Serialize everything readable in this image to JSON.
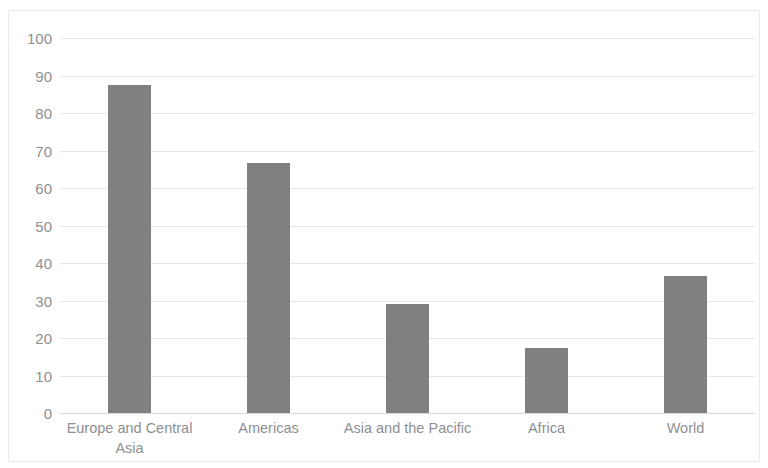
{
  "chart_data": {
    "type": "bar",
    "title": "",
    "subtitle": "",
    "xlabel": "",
    "ylabel": "",
    "categories": [
      "Europe and Central Asia",
      "Americas",
      "Asia and the Pacific",
      "Africa",
      "World"
    ],
    "values": [
      87.5,
      66.8,
      29.0,
      17.3,
      36.6
    ],
    "ylim": [
      0,
      100
    ],
    "yticks": [
      0,
      10,
      20,
      30,
      40,
      50,
      60,
      70,
      80,
      90,
      100
    ],
    "ytick_labels": [
      "0",
      "10",
      "20",
      "30",
      "40",
      "50",
      "60",
      "70",
      "80",
      "90",
      "100"
    ],
    "grid": true,
    "grid_axis": "y",
    "legend": false,
    "legend_position": "none",
    "series": [
      {
        "name": "",
        "values": [
          87.5,
          66.8,
          29.0,
          17.3,
          36.6
        ]
      }
    ],
    "colors": {
      "bar_fill": "#808080",
      "gridline": "#e6e7e9",
      "axis_line": "#d8d9db",
      "tick_label": "#8d8f92",
      "frame": "#e9eaec",
      "background": "#ffffff"
    }
  }
}
